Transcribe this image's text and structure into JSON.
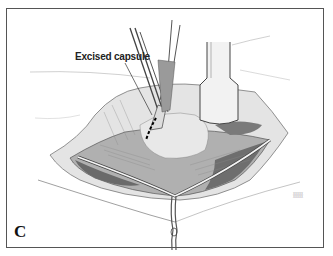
{
  "figure": {
    "panel_label": "C",
    "annotation": "Excised capsule",
    "artist_signature": [
      "XXXXX",
      "XXXXX"
    ],
    "colors": {
      "border": "#555555",
      "ink": "#222222",
      "tissue_dark": "#6a6a6a",
      "tissue_light": "#d8d8d8",
      "background": "#ffffff"
    }
  }
}
